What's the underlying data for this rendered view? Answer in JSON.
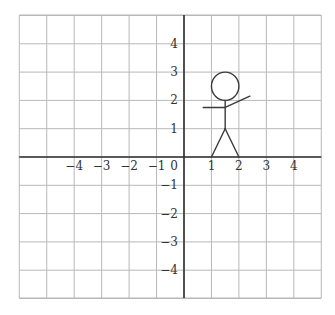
{
  "diagram": {
    "type": "coordinate-plane",
    "x_range": [
      -6,
      5
    ],
    "y_range": [
      -5,
      5
    ],
    "grid": true,
    "x_tick_labels": [
      "-4",
      "-3",
      "-2",
      "-1",
      "0",
      "1",
      "2",
      "3",
      "4"
    ],
    "x_tick_values": [
      -4,
      -3,
      -2,
      -1,
      0,
      1,
      2,
      3,
      4
    ],
    "y_tick_labels": [
      "4",
      "3",
      "2",
      "1",
      "-1",
      "-2",
      "-3",
      "-4"
    ],
    "y_tick_values": [
      4,
      3,
      2,
      1,
      -1,
      -2,
      -3,
      -4
    ],
    "origin_label": "0",
    "colors": {
      "grid": "#b8b8b8",
      "axis": "#2e2e2e",
      "label": "#333333",
      "figure": "#3a3a3a"
    },
    "stick_figure": {
      "head": {
        "cx": 1.5,
        "cy": 2.5,
        "r": 0.5
      },
      "body": {
        "from": [
          1.5,
          2
        ],
        "to": [
          1.5,
          1
        ]
      },
      "left_arm": {
        "from": [
          0.7,
          1.75
        ],
        "to": [
          1.5,
          1.75
        ]
      },
      "right_arm": {
        "from": [
          1.5,
          1.75
        ],
        "to": [
          2.4,
          2.15
        ]
      },
      "left_leg": {
        "from": [
          1.5,
          1
        ],
        "to": [
          1,
          0
        ]
      },
      "right_leg": {
        "from": [
          1.5,
          1
        ],
        "to": [
          2,
          0
        ]
      }
    }
  }
}
